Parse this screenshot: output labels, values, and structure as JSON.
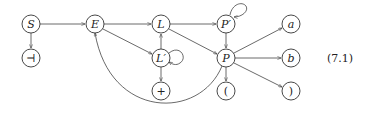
{
  "diagram": {
    "type": "directed-graph",
    "equation_number": "(7.1)",
    "nodes": [
      {
        "id": "S",
        "label": "S",
        "x": 31,
        "y": 24,
        "italic": true
      },
      {
        "id": "end",
        "label": "⊣",
        "x": 31,
        "y": 58,
        "italic": false
      },
      {
        "id": "E",
        "label": "E",
        "x": 95,
        "y": 24,
        "italic": true
      },
      {
        "id": "L",
        "label": "L",
        "x": 161,
        "y": 24,
        "italic": true
      },
      {
        "id": "Lp",
        "label": "L′",
        "x": 161,
        "y": 58,
        "italic": true
      },
      {
        "id": "plus",
        "label": "+",
        "x": 161,
        "y": 91,
        "italic": false
      },
      {
        "id": "Pp",
        "label": "P′",
        "x": 226,
        "y": 24,
        "italic": true
      },
      {
        "id": "P",
        "label": "P",
        "x": 226,
        "y": 58,
        "italic": true
      },
      {
        "id": "lparen",
        "label": "(",
        "x": 226,
        "y": 91,
        "italic": false
      },
      {
        "id": "a",
        "label": "a",
        "x": 291,
        "y": 24,
        "italic": true
      },
      {
        "id": "b",
        "label": "b",
        "x": 291,
        "y": 58,
        "italic": true
      },
      {
        "id": "rparen",
        "label": ")",
        "x": 291,
        "y": 91,
        "italic": false
      }
    ],
    "edges": [
      {
        "from": "S",
        "to": "end"
      },
      {
        "from": "S",
        "to": "E"
      },
      {
        "from": "E",
        "to": "L"
      },
      {
        "from": "E",
        "to": "Lp"
      },
      {
        "from": "Lp",
        "to": "L"
      },
      {
        "from": "Lp",
        "to": "Lp",
        "loop": true
      },
      {
        "from": "Lp",
        "to": "plus"
      },
      {
        "from": "L",
        "to": "Pp"
      },
      {
        "from": "L",
        "to": "P"
      },
      {
        "from": "Pp",
        "to": "Pp",
        "loop": true
      },
      {
        "from": "Pp",
        "to": "P"
      },
      {
        "from": "P",
        "to": "a"
      },
      {
        "from": "P",
        "to": "b"
      },
      {
        "from": "P",
        "to": "rparen"
      },
      {
        "from": "P",
        "to": "lparen"
      },
      {
        "from": "P",
        "to": "E",
        "curved": true
      }
    ]
  }
}
